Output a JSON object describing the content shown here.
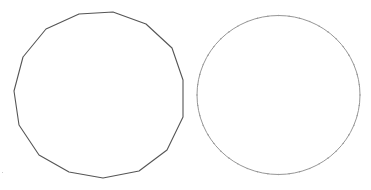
{
  "canvas": {
    "width": 371,
    "height": 190,
    "background": "#ffffff"
  },
  "shapes": [
    {
      "name": "polygon-15-sided",
      "type": "polygon",
      "sides": 15,
      "stroke": "#555555",
      "stroke_width": 1.1,
      "fill": "none",
      "points": [
        [
          79,
          14
        ],
        [
          113,
          12
        ],
        [
          146,
          24
        ],
        [
          172,
          48
        ],
        [
          183,
          80
        ],
        [
          183,
          117
        ],
        [
          167,
          150
        ],
        [
          139,
          171
        ],
        [
          103,
          178
        ],
        [
          69,
          172
        ],
        [
          39,
          155
        ],
        [
          19,
          125
        ],
        [
          14,
          91
        ],
        [
          23,
          57
        ],
        [
          46,
          29
        ]
      ]
    },
    {
      "name": "circle-many-sided",
      "type": "ellipse",
      "cx": 278.5,
      "cy": 95,
      "rx": 81.5,
      "ry": 79.5,
      "stroke": "#8a8a8a",
      "stroke_width": 0.9,
      "fill": "none",
      "vertex_markers": 48,
      "marker_color": "#9a9a9a"
    }
  ],
  "specks": [
    {
      "x": 2,
      "y": 172,
      "color": "#cccccc"
    }
  ]
}
